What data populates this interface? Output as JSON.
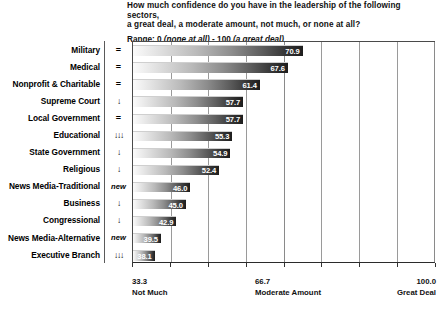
{
  "header": {
    "question_line1": "How much confidence do you have in the leadership of the following sectors,",
    "question_line2": "a great deal, a moderate amount, not much, or none at all?",
    "range_prefix": "Range: 0 ",
    "range_low": "(none at all)",
    "range_mid": " - 100 ",
    "range_high": "(a great deal)"
  },
  "axis": {
    "left_value": "33.3",
    "left_name": "Not Much",
    "mid_value": "66.7",
    "mid_name": "Moderate Amount",
    "right_value": "100.0",
    "right_name": "Great Deal"
  },
  "chart_data": {
    "type": "bar",
    "orientation": "horizontal",
    "title": "How much confidence do you have in the leadership of the following sectors, a great deal, a moderate amount, not much, or none at all?",
    "subtitle": "Range: 0 (none at all) - 100 (a great deal)",
    "xlabel": "",
    "ylabel": "",
    "xlim": [
      33.3,
      100.0
    ],
    "xticks": [
      33.3,
      66.7,
      100.0
    ],
    "xtick_labels": [
      "33.3",
      "66.7",
      "100.0"
    ],
    "xtick_names": [
      "Not Much",
      "Moderate Amount",
      "Great Deal"
    ],
    "grid": true,
    "legend": "none",
    "categories": [
      "Military",
      "Medical",
      "Nonprofit & Charitable",
      "Supreme Court",
      "Local Government",
      "Educational",
      "State Government",
      "Religious",
      "News Media-Traditional",
      "Business",
      "Congressional",
      "News Media-Alternative",
      "Executive Branch"
    ],
    "values": [
      70.9,
      67.6,
      61.4,
      57.7,
      57.7,
      55.3,
      54.9,
      52.4,
      46.0,
      45.0,
      42.9,
      39.5,
      38.1
    ],
    "value_labels": [
      "70.9",
      "67.6",
      "61.4",
      "57.7",
      "57.7",
      "55.3",
      "54.9",
      "52.4",
      "46.0",
      "45.0",
      "42.9",
      "39.5",
      "38.1"
    ],
    "trend_indicators": [
      "=",
      "=",
      "=",
      "↓",
      "=",
      "↓↓↓",
      "↓",
      "↓",
      "new",
      "↓",
      "↓",
      "new",
      "↓↓↓"
    ],
    "trend_kinds": [
      "equal",
      "equal",
      "equal",
      "down",
      "equal",
      "down3",
      "down",
      "down",
      "new",
      "down",
      "down",
      "new",
      "down3"
    ]
  }
}
